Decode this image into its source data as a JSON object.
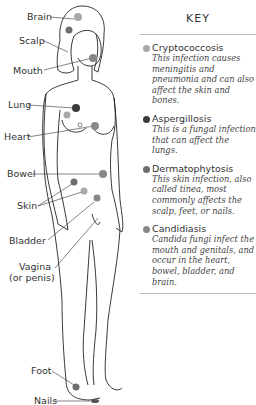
{
  "figure": {
    "labels": [
      {
        "id": "brain",
        "text": "Brain",
        "x": 27,
        "y": 12
      },
      {
        "id": "scalp",
        "text": "Scalp",
        "x": 19,
        "y": 37
      },
      {
        "id": "mouth",
        "text": "Mouth",
        "x": 13,
        "y": 67
      },
      {
        "id": "lung",
        "text": "Lung",
        "x": 8,
        "y": 100
      },
      {
        "id": "heart",
        "text": "Heart",
        "x": 4,
        "y": 132
      },
      {
        "id": "bowel",
        "text": "Bowel",
        "x": 7,
        "y": 169
      },
      {
        "id": "skin",
        "text": "Skin",
        "x": 17,
        "y": 201
      },
      {
        "id": "bladder",
        "text": "Bladder",
        "x": 9,
        "y": 236
      },
      {
        "id": "vagina",
        "text": "Vagina",
        "x": 19,
        "y": 263
      },
      {
        "id": "vagina_sub",
        "text": "(or penis)",
        "x": 9,
        "y": 273
      },
      {
        "id": "foot",
        "text": "Foot",
        "x": 31,
        "y": 367
      },
      {
        "id": "nails",
        "text": "Nails",
        "x": 34,
        "y": 397
      }
    ],
    "infection_sites": [
      {
        "site": "brain",
        "type": "cryptococcosis",
        "x": 78,
        "y": 17
      },
      {
        "site": "scalp",
        "type": "dermatophytosis",
        "x": 69,
        "y": 30
      },
      {
        "site": "mouth",
        "type": "candidiasis",
        "x": 93,
        "y": 57
      },
      {
        "site": "lung",
        "type": "aspergillosis",
        "x": 76,
        "y": 108
      },
      {
        "site": "lung2",
        "type": "cryptococcosis",
        "x": 67,
        "y": 117
      },
      {
        "site": "heart",
        "type": "candidiasis",
        "x": 95,
        "y": 124
      },
      {
        "site": "bowel",
        "type": "candidiasis",
        "x": 103,
        "y": 174
      },
      {
        "site": "skin1",
        "type": "dermatophytosis",
        "x": 74,
        "y": 182
      },
      {
        "site": "skin2",
        "type": "cryptococcosis",
        "x": 84,
        "y": 190
      },
      {
        "site": "bladder",
        "type": "candidiasis",
        "x": 97,
        "y": 198
      },
      {
        "site": "foot",
        "type": "dermatophytosis",
        "x": 76,
        "y": 387
      }
    ]
  },
  "key": {
    "title": "KEY",
    "items": [
      {
        "name": "Cryptococcosis",
        "description": "This infection causes meningitis and pneumonia and can also affect the skin and bones.",
        "color": "#a8a8a8"
      },
      {
        "name": "Aspergillosis",
        "description": "This is a fungal infection that can affect the lungs.",
        "color": "#3a3a3a"
      },
      {
        "name": "Dermatophytosis",
        "description": "This skin infection, also called tinea, most commonly affects the scalp, feet, or nails.",
        "color": "#6e6e6e"
      },
      {
        "name": "Candidiasis",
        "description": "Candida fungi infect the mouth and genitals, and occur in the heart, bowel, bladder, and brain.",
        "color": "#888888"
      }
    ]
  },
  "colors": {
    "cryptococcosis": "#a8a8a8",
    "aspergillosis": "#3a3a3a",
    "dermatophytosis": "#6e6e6e",
    "candidiasis": "#888888"
  }
}
